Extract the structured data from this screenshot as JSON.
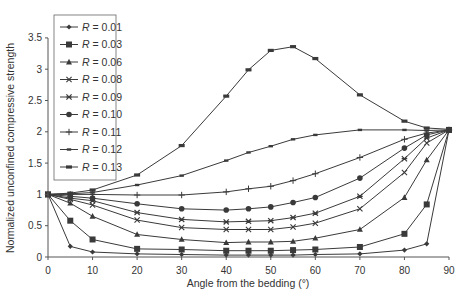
{
  "chart_data": {
    "type": "line",
    "title": "",
    "xlabel": "Angle from the bedding (°)",
    "ylabel": "Normalized unconfined compressive strength",
    "xlim": [
      0,
      90
    ],
    "ylim": [
      0,
      3.5
    ],
    "xticks": [
      0,
      10,
      20,
      30,
      40,
      50,
      60,
      70,
      80,
      90
    ],
    "yticks": [
      0,
      0.5,
      1,
      1.5,
      2,
      2.5,
      3,
      3.5
    ],
    "ytick_labels": [
      "0",
      "0.5",
      "1",
      "1.5",
      "2",
      "2.5",
      "3",
      "3.5"
    ],
    "grid": false,
    "legend_position": "upper-left (inside)",
    "x": [
      0,
      5,
      10,
      20,
      30,
      40,
      45,
      50,
      55,
      60,
      70,
      80,
      85,
      90
    ],
    "series": [
      {
        "name": "R = 0.01",
        "marker": "diamond",
        "values": [
          1,
          0.17,
          0.08,
          0.05,
          0.04,
          0.03,
          0.03,
          0.03,
          0.03,
          0.04,
          0.05,
          0.11,
          0.21,
          2.03
        ]
      },
      {
        "name": "R = 0.03",
        "marker": "square",
        "values": [
          1,
          0.58,
          0.28,
          0.13,
          0.12,
          0.1,
          0.1,
          0.1,
          0.11,
          0.12,
          0.16,
          0.37,
          0.84,
          2.03
        ]
      },
      {
        "name": "R = 0.06",
        "marker": "triangle",
        "values": [
          1,
          0.86,
          0.65,
          0.36,
          0.28,
          0.23,
          0.24,
          0.24,
          0.25,
          0.3,
          0.44,
          0.95,
          1.55,
          2.03
        ]
      },
      {
        "name": "R = 0.08",
        "marker": "x",
        "values": [
          1,
          0.92,
          0.83,
          0.59,
          0.47,
          0.44,
          0.44,
          0.44,
          0.48,
          0.54,
          0.77,
          1.35,
          1.82,
          2.03
        ]
      },
      {
        "name": "R = 0.09",
        "marker": "star",
        "values": [
          1,
          0.94,
          0.9,
          0.71,
          0.6,
          0.56,
          0.57,
          0.58,
          0.63,
          0.7,
          0.97,
          1.57,
          1.9,
          2.03
        ]
      },
      {
        "name": "R = 0.10",
        "marker": "circle",
        "values": [
          1,
          0.97,
          0.94,
          0.85,
          0.77,
          0.75,
          0.77,
          0.8,
          0.87,
          0.95,
          1.26,
          1.74,
          1.95,
          2.03
        ]
      },
      {
        "name": "R = 0.11",
        "marker": "plus",
        "values": [
          1,
          1.0,
          1.0,
          0.99,
          0.99,
          1.04,
          1.09,
          1.13,
          1.22,
          1.33,
          1.59,
          1.88,
          1.98,
          2.03
        ]
      },
      {
        "name": "R = 0.12",
        "marker": "dash",
        "values": [
          1,
          1.01,
          1.03,
          1.15,
          1.3,
          1.54,
          1.67,
          1.77,
          1.88,
          1.95,
          2.03,
          2.03,
          2.02,
          2.03
        ]
      },
      {
        "name": "R = 0.13",
        "marker": "bar",
        "values": [
          1,
          1.02,
          1.07,
          1.31,
          1.78,
          2.57,
          2.99,
          3.3,
          3.36,
          3.17,
          2.59,
          2.17,
          2.06,
          2.04
        ]
      }
    ],
    "line_color": "#3a3a3a"
  }
}
